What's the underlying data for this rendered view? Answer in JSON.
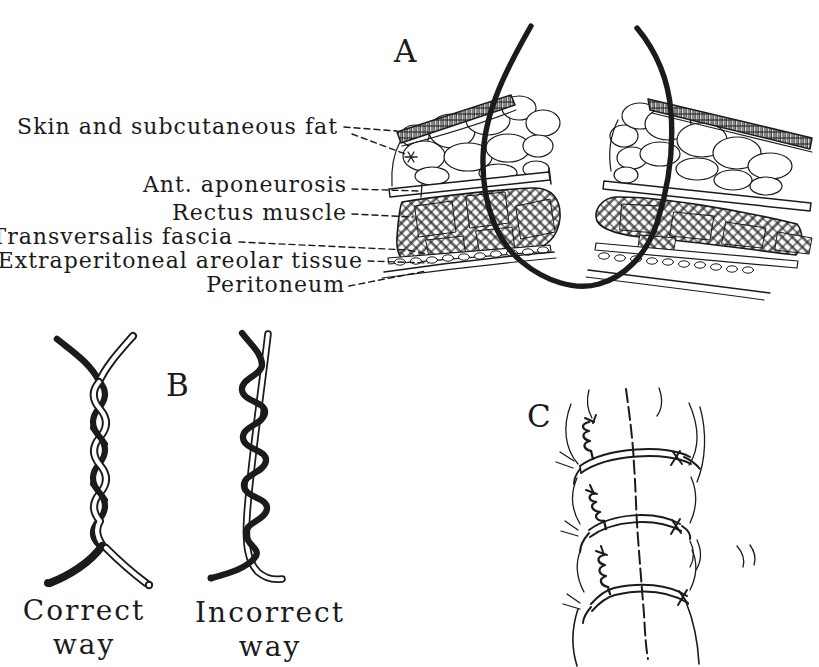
{
  "figure": {
    "background_color": "#ffffff",
    "ink_color": "#1b1b1b"
  },
  "panel_a": {
    "letter": "A",
    "layer_labels": [
      "Skin and subcutaneous fat",
      "Ant. aponeurosis",
      "Rectus muscle",
      "Transversalis fascia",
      "Extraperitoneal areolar tissue",
      "Peritoneum"
    ]
  },
  "panel_b": {
    "letter": "B",
    "left_caption": {
      "line1": "Correct",
      "line2": "way"
    },
    "right_caption": {
      "line1": "Incorrect",
      "line2": "way"
    }
  },
  "panel_c": {
    "letter": "C"
  }
}
